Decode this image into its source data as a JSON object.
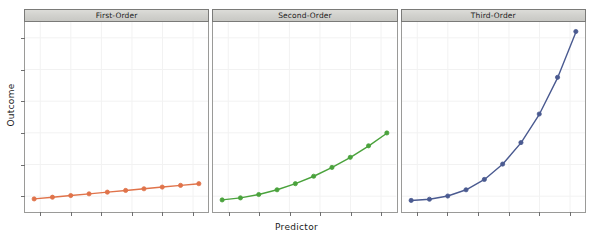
{
  "chart_data": {
    "type": "line",
    "title": "",
    "subtitle": "",
    "xlabel": "Predictor",
    "ylabel": "Outcome",
    "grid": true,
    "legend_position": "none",
    "layout": "3 panels side-by-side (trellis / lattice conditioning)",
    "xlim": [
      1,
      10
    ],
    "ylim": [
      0,
      1000
    ],
    "x_tick_count": 6,
    "y_tick_count": 6,
    "x_tick_labels": [],
    "y_tick_labels": [],
    "shared_x": [
      1,
      2,
      3,
      4,
      5,
      6,
      7,
      8,
      9,
      10
    ],
    "panels": [
      {
        "strip_label": "First-Order",
        "series_name": "First-Order",
        "color": "#e0734a",
        "equation": "y = 10x",
        "x": [
          1,
          2,
          3,
          4,
          5,
          6,
          7,
          8,
          9,
          10
        ],
        "values": [
          10,
          20,
          30,
          40,
          50,
          60,
          70,
          80,
          90,
          100
        ]
      },
      {
        "strip_label": "Second-Order",
        "series_name": "Second-Order",
        "color": "#4aa23c",
        "equation": "y = 4x^2",
        "x": [
          1,
          2,
          3,
          4,
          5,
          6,
          7,
          8,
          9,
          10
        ],
        "values": [
          4,
          16,
          36,
          64,
          100,
          144,
          196,
          256,
          324,
          400
        ]
      },
      {
        "strip_label": "Third-Order",
        "series_name": "Third-Order",
        "color": "#4a5a90",
        "equation": "y = x^3",
        "x": [
          1,
          2,
          3,
          4,
          5,
          6,
          7,
          8,
          9,
          10
        ],
        "values": [
          1,
          8,
          27,
          64,
          125,
          216,
          343,
          512,
          729,
          1000
        ]
      }
    ]
  },
  "figure": {
    "ylabel": "Outcome",
    "xlabel": "Predictor"
  },
  "colors": {
    "first_order": "#e0734a",
    "second_order": "#4aa23c",
    "third_order": "#4a5a90",
    "strip_background": "#d4d4d0",
    "panel_border": "#9a9a98",
    "gridline": "#f2f2f2",
    "tick": "#6f6f6f",
    "background": "#ffffff"
  }
}
